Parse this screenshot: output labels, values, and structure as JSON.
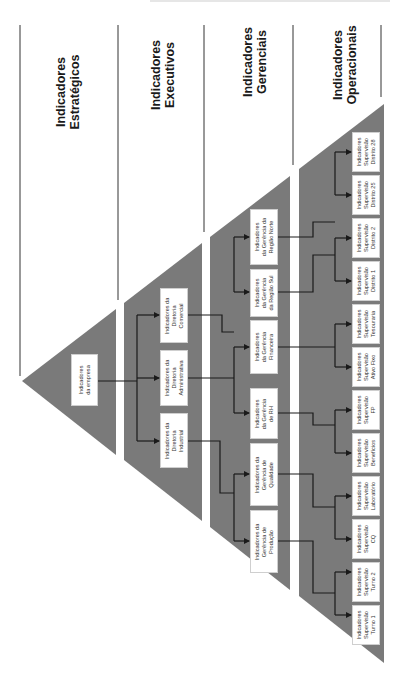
{
  "colors": {
    "band_fill": "#7a7a7a",
    "line": "#1a1a1a",
    "box_bg": "#ffffff",
    "text": "#1a1a1a"
  },
  "levels": [
    {
      "id": "estrategicos",
      "line1": "Indicadores",
      "line2": "Estratégicos"
    },
    {
      "id": "executivos",
      "line1": "Indicadores",
      "line2": "Executivos"
    },
    {
      "id": "gerenciais",
      "line1": "Indicadores",
      "line2": "Gerenciais"
    },
    {
      "id": "operacionais",
      "line1": "Indicadores",
      "line2": "Operacionais"
    }
  ],
  "nodes": {
    "empresa": {
      "l1": "Indicadores",
      "l2": "da empresa",
      "l3": ""
    },
    "dir_comercial": {
      "l1": "Indicadores da",
      "l2": "Diretoria",
      "l3": "Comercial"
    },
    "dir_administrativa": {
      "l1": "Indicadores da",
      "l2": "Diretoria",
      "l3": "Administrativa"
    },
    "dir_industrial": {
      "l1": "Indicadores da",
      "l2": "Diretoria",
      "l3": "Industrial"
    },
    "ger_norte": {
      "l1": "Indicadores",
      "l2": "da Gerência da",
      "l3": "Região Norte"
    },
    "ger_sul": {
      "l1": "Indicadores",
      "l2": "da Gerência",
      "l3": "da Região Sul"
    },
    "ger_financeira": {
      "l1": "Indicadores",
      "l2": "da Gerência",
      "l3": "Financeira"
    },
    "ger_rh": {
      "l1": "Indicadores",
      "l2": "da Gerência",
      "l3": "de RH"
    },
    "ger_qualidade": {
      "l1": "Indicadores da",
      "l2": "Gerência de",
      "l3": "Qualidade"
    },
    "ger_producao": {
      "l1": "Indicadores da",
      "l2": "Gerência de",
      "l3": "Produção"
    },
    "sup_d28": {
      "l1": "Indicadores",
      "l2": "Supervisão",
      "l3": "Distrito 28"
    },
    "sup_d25": {
      "l1": "Indicadores",
      "l2": "Supervisão",
      "l3": "Distrito 25"
    },
    "sup_d2": {
      "l1": "Indicadores",
      "l2": "Supervisão",
      "l3": "Distrito 2"
    },
    "sup_d1": {
      "l1": "Indicadores",
      "l2": "Supervisão",
      "l3": "Distrito 1"
    },
    "sup_tesouraria": {
      "l1": "Indicadores",
      "l2": "Supervisão",
      "l3": "Tesouraria"
    },
    "sup_ativo_fixo": {
      "l1": "Indicadores",
      "l2": "Supervisão",
      "l3": "Ativo Fixo"
    },
    "sup_fp": {
      "l1": "Indicadores",
      "l2": "Supervisão",
      "l3": "FP"
    },
    "sup_beneficios": {
      "l1": "Indicadores",
      "l2": "Supervisão",
      "l3": "Benefícios"
    },
    "sup_laboratorio": {
      "l1": "Indicadores",
      "l2": "Supervisão",
      "l3": "Laboratório"
    },
    "sup_cq": {
      "l1": "Indicadores",
      "l2": "Supervisão",
      "l3": "CQ"
    },
    "sup_turno2": {
      "l1": "Indicadores",
      "l2": "Supervisão",
      "l3": "Turno 2"
    },
    "sup_turno1": {
      "l1": "Indicadores",
      "l2": "Supervisão",
      "l3": "Turno 1"
    }
  },
  "hierarchy": [
    {
      "parent": "empresa",
      "children": [
        "dir_comercial",
        "dir_administrativa",
        "dir_industrial"
      ]
    },
    {
      "parent": "dir_comercial",
      "children": [
        "ger_norte",
        "ger_sul"
      ]
    },
    {
      "parent": "dir_administrativa",
      "children": [
        "ger_financeira",
        "ger_rh"
      ]
    },
    {
      "parent": "dir_industrial",
      "children": [
        "ger_qualidade",
        "ger_producao"
      ]
    },
    {
      "parent": "ger_norte",
      "children": [
        "sup_d28",
        "sup_d25"
      ]
    },
    {
      "parent": "ger_sul",
      "children": [
        "sup_d2",
        "sup_d1"
      ]
    },
    {
      "parent": "ger_financeira",
      "children": [
        "sup_tesouraria",
        "sup_ativo_fixo"
      ]
    },
    {
      "parent": "ger_rh",
      "children": [
        "sup_fp",
        "sup_beneficios"
      ]
    },
    {
      "parent": "ger_qualidade",
      "children": [
        "sup_laboratorio",
        "sup_cq"
      ]
    },
    {
      "parent": "ger_producao",
      "children": [
        "sup_turno2",
        "sup_turno1"
      ]
    }
  ]
}
